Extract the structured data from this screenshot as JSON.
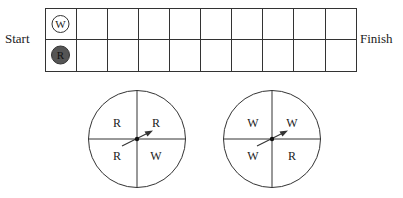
{
  "board": {
    "start_label": "Start",
    "finish_label": "Finish",
    "rows": 2,
    "columns": 10,
    "tokens": [
      {
        "label": "W",
        "color": "white",
        "row": 0,
        "column": 0
      },
      {
        "label": "R",
        "color": "dark gray",
        "row": 1,
        "column": 0
      }
    ]
  },
  "spinners": [
    {
      "sections": {
        "top_left": "R",
        "top_right": "R",
        "bottom_left": "R",
        "bottom_right": "W"
      }
    },
    {
      "sections": {
        "top_left": "W",
        "top_right": "W",
        "bottom_left": "W",
        "bottom_right": "R"
      }
    }
  ],
  "colors": {
    "line": "#333333",
    "red_token": "#555555",
    "white_token": "#ffffff"
  }
}
